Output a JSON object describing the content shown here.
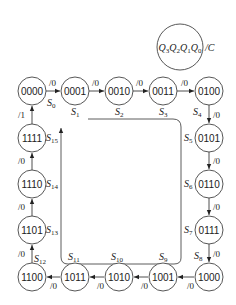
{
  "diagram": {
    "type": "state-transition-diagram",
    "legend": {
      "state_label": "Q3Q2Q1Q0",
      "output_label": "/C"
    },
    "states": [
      {
        "id": "S0",
        "label": "S0",
        "code": "0000",
        "cx": 32,
        "cy": 91
      },
      {
        "id": "S1",
        "label": "S1",
        "code": "0001",
        "cx": 75,
        "cy": 91
      },
      {
        "id": "S2",
        "label": "S2",
        "code": "0010",
        "cx": 119,
        "cy": 91
      },
      {
        "id": "S3",
        "label": "S3",
        "code": "0011",
        "cx": 163,
        "cy": 91
      },
      {
        "id": "S4",
        "label": "S4",
        "code": "0100",
        "cx": 209,
        "cy": 91
      },
      {
        "id": "S5",
        "label": "S5",
        "code": "0101",
        "cx": 209,
        "cy": 138
      },
      {
        "id": "S6",
        "label": "S6",
        "code": "0110",
        "cx": 209,
        "cy": 184
      },
      {
        "id": "S7",
        "label": "S7",
        "code": "0111",
        "cx": 209,
        "cy": 230
      },
      {
        "id": "S8",
        "label": "S8",
        "code": "1000",
        "cx": 209,
        "cy": 277
      },
      {
        "id": "S9",
        "label": "S9",
        "code": "1001",
        "cx": 163,
        "cy": 277
      },
      {
        "id": "S10",
        "label": "S10",
        "code": "1010",
        "cx": 119,
        "cy": 277
      },
      {
        "id": "S11",
        "label": "S11",
        "code": "1011",
        "cx": 75,
        "cy": 277
      },
      {
        "id": "S12",
        "label": "S12",
        "code": "1100",
        "cx": 32,
        "cy": 277
      },
      {
        "id": "S13",
        "label": "S13",
        "code": "1101",
        "cx": 32,
        "cy": 230
      },
      {
        "id": "S14",
        "label": "S14",
        "code": "1110",
        "cx": 32,
        "cy": 184
      },
      {
        "id": "S15",
        "label": "S15",
        "code": "1111",
        "cx": 32,
        "cy": 138
      }
    ],
    "transitions": [
      {
        "from": "S0",
        "to": "S1",
        "output": "/0"
      },
      {
        "from": "S1",
        "to": "S2",
        "output": "/0"
      },
      {
        "from": "S2",
        "to": "S3",
        "output": "/0"
      },
      {
        "from": "S3",
        "to": "S4",
        "output": "/0"
      },
      {
        "from": "S4",
        "to": "S5",
        "output": "/0"
      },
      {
        "from": "S5",
        "to": "S6",
        "output": "/0"
      },
      {
        "from": "S6",
        "to": "S7",
        "output": "/0"
      },
      {
        "from": "S7",
        "to": "S8",
        "output": "/0"
      },
      {
        "from": "S8",
        "to": "S9",
        "output": "/0"
      },
      {
        "from": "S9",
        "to": "S10",
        "output": "/0"
      },
      {
        "from": "S10",
        "to": "S11",
        "output": "/0"
      },
      {
        "from": "S11",
        "to": "S12",
        "output": "/0"
      },
      {
        "from": "S12",
        "to": "S13",
        "output": "/0"
      },
      {
        "from": "S13",
        "to": "S14",
        "output": "/0"
      },
      {
        "from": "S14",
        "to": "S15",
        "output": "/0"
      },
      {
        "from": "S15",
        "to": "S0",
        "output": "/1"
      }
    ]
  }
}
